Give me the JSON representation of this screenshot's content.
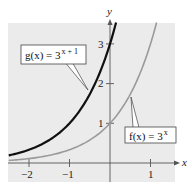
{
  "chart_data": {
    "type": "line",
    "title": "",
    "xlabel": "x",
    "ylabel": "y",
    "xlim": [
      -2.5,
      1.6
    ],
    "ylim": [
      -0.5,
      3.5
    ],
    "grid": false,
    "x_ticks": [
      -2,
      -1,
      1
    ],
    "x_tick_labels": [
      "−2",
      "−1",
      "1"
    ],
    "y_ticks": [
      1,
      2,
      3
    ],
    "y_tick_labels": [
      "1",
      "2",
      "3"
    ],
    "series": [
      {
        "name": "g(x) = 3^(x+1)",
        "label_main": "g(x) = 3",
        "label_exp": "x + 1",
        "color": "#111111",
        "x": [
          -2.5,
          -2,
          -1.5,
          -1,
          -0.5,
          0,
          0.15
        ],
        "values": [
          0.19,
          0.33,
          0.58,
          1.0,
          1.73,
          3.0,
          3.53
        ]
      },
      {
        "name": "f(x) = 3^x",
        "label_main": "f(x) = 3",
        "label_exp": "x",
        "color": "#9a9a9a",
        "x": [
          -2.5,
          -2,
          -1.5,
          -1,
          -0.5,
          0,
          0.5,
          1,
          1.15
        ],
        "values": [
          0.06,
          0.11,
          0.19,
          0.33,
          0.58,
          1.0,
          1.73,
          3.0,
          3.53
        ]
      }
    ],
    "annotations": [
      {
        "text": "g(x) = 3^(x+1)",
        "points_to": [
          -0.55,
          1.8
        ]
      },
      {
        "text": "f(x) = 3^x",
        "points_to": [
          0.5,
          1.7
        ]
      }
    ]
  },
  "colors": {
    "plot_background": "#ebebeb",
    "axis": "#555555",
    "g_curve": "#111111",
    "f_curve": "#9a9a9a"
  }
}
